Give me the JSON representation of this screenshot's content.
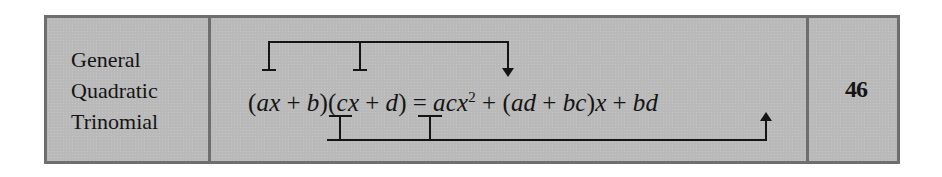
{
  "row": {
    "label_lines": [
      "General",
      "Quadratic",
      "Trinomial"
    ],
    "formula": {
      "lhs_factor_1": {
        "open": "(",
        "a": "ax",
        "plus": "+",
        "b": "b",
        "close": ")"
      },
      "lhs_factor_2": {
        "open": "(",
        "c": "cx",
        "plus": "+",
        "d": "d",
        "close": ")"
      },
      "equals": "=",
      "rhs": {
        "term1": "acx",
        "term1_exponent": "2",
        "plus1": "+",
        "term2_open": "(",
        "term2_a": "ad",
        "term2_plus": "+",
        "term2_b": "bc",
        "term2_close": ")",
        "term2_var": "x",
        "plus2": "+",
        "term3": "bd"
      },
      "plain_text": "(ax + b)(cx + d) = acx^2 + (ad + bc)x + bd"
    },
    "reference_number": "46"
  },
  "annotations": {
    "top_bracket": {
      "connects": [
        "ax",
        "cx"
      ],
      "points_to": "acx^2",
      "arrow": "down-arrow"
    },
    "bottom_bracket": {
      "connects": [
        "b",
        "d"
      ],
      "points_to": "bd",
      "arrow": "up-arrow"
    }
  },
  "colors": {
    "cell_background": "#b9b9b9",
    "border": "#6e6e6e",
    "ink": "#141414"
  }
}
